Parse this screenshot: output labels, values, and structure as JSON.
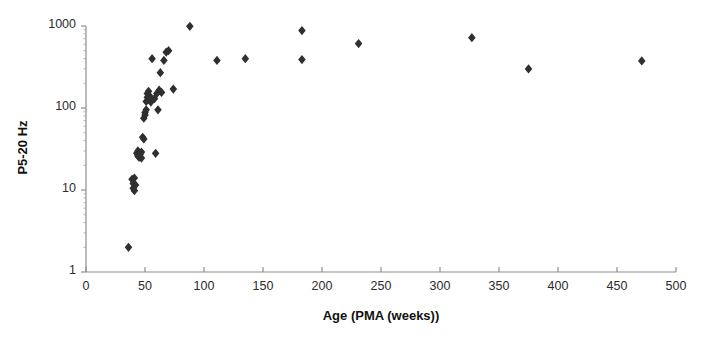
{
  "chart_data": {
    "type": "scatter",
    "title": "",
    "xlabel": "Age (PMA (weeks))",
    "ylabel": "P5-20 Hz",
    "xlim": [
      0,
      500
    ],
    "ylim": [
      1,
      1000
    ],
    "yscale": "log",
    "xscale": "linear",
    "grid": false,
    "legend": null,
    "marker": "diamond",
    "marker_color": "#2f2f2f",
    "xticks": [
      0,
      50,
      100,
      150,
      200,
      250,
      300,
      350,
      400,
      450,
      500
    ],
    "xtick_labels": [
      "0",
      "50",
      "100",
      "150",
      "200",
      "250",
      "300",
      "350",
      "400",
      "450",
      "500"
    ],
    "yticks": [
      1,
      10,
      100,
      1000
    ],
    "ytick_labels": [
      "1",
      "10",
      "100",
      "1000"
    ],
    "points": [
      {
        "x": 36,
        "y": 2.0
      },
      {
        "x": 39,
        "y": 13.5
      },
      {
        "x": 40,
        "y": 12.0
      },
      {
        "x": 40,
        "y": 10.5
      },
      {
        "x": 41,
        "y": 9.8
      },
      {
        "x": 41,
        "y": 14.0
      },
      {
        "x": 42,
        "y": 11.5
      },
      {
        "x": 43,
        "y": 28.0
      },
      {
        "x": 44,
        "y": 26.0
      },
      {
        "x": 44,
        "y": 30.0
      },
      {
        "x": 45,
        "y": 25.0
      },
      {
        "x": 46,
        "y": 27.5
      },
      {
        "x": 47,
        "y": 29.0
      },
      {
        "x": 47,
        "y": 24.5
      },
      {
        "x": 48,
        "y": 44.0
      },
      {
        "x": 49,
        "y": 42.0
      },
      {
        "x": 49,
        "y": 75.0
      },
      {
        "x": 50,
        "y": 82.0
      },
      {
        "x": 50,
        "y": 88.0
      },
      {
        "x": 51,
        "y": 95.0
      },
      {
        "x": 51,
        "y": 120.0
      },
      {
        "x": 52,
        "y": 135.0
      },
      {
        "x": 52,
        "y": 150.0
      },
      {
        "x": 53,
        "y": 160.0
      },
      {
        "x": 53,
        "y": 128.0
      },
      {
        "x": 54,
        "y": 140.0
      },
      {
        "x": 55,
        "y": 118.0
      },
      {
        "x": 56,
        "y": 400.0
      },
      {
        "x": 58,
        "y": 130.0
      },
      {
        "x": 59,
        "y": 28.0
      },
      {
        "x": 60,
        "y": 150.0
      },
      {
        "x": 61,
        "y": 95.0
      },
      {
        "x": 62,
        "y": 165.0
      },
      {
        "x": 63,
        "y": 270.0
      },
      {
        "x": 64,
        "y": 155.0
      },
      {
        "x": 66,
        "y": 380.0
      },
      {
        "x": 68,
        "y": 480.0
      },
      {
        "x": 70,
        "y": 500.0
      },
      {
        "x": 74,
        "y": 170.0
      },
      {
        "x": 88,
        "y": 990.0
      },
      {
        "x": 111,
        "y": 380.0
      },
      {
        "x": 135,
        "y": 400.0
      },
      {
        "x": 183,
        "y": 880.0
      },
      {
        "x": 183,
        "y": 390.0
      },
      {
        "x": 231,
        "y": 610.0
      },
      {
        "x": 327,
        "y": 720.0
      },
      {
        "x": 375,
        "y": 300.0
      },
      {
        "x": 471,
        "y": 375.0
      }
    ]
  },
  "axes": {
    "x_axis_name": "horizontal-axis",
    "y_axis_name": "vertical-axis"
  }
}
